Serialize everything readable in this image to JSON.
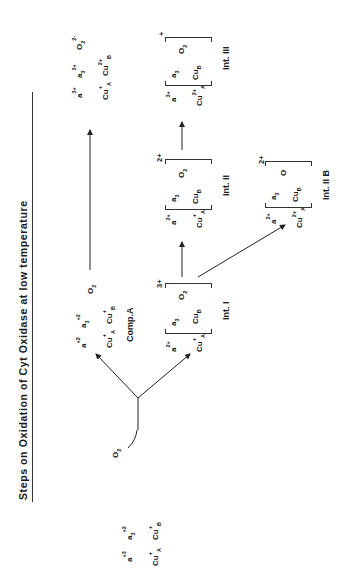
{
  "title": "Steps  on Oxidation of Cyt Oxidase at low temperature",
  "start": {
    "a": "a",
    "a_charge": "+3",
    "a3": "a",
    "a3_sub": "3",
    "a3_charge": "+2",
    "cuA": "Cu",
    "cuA_sup": "+",
    "cuA_sub": "A",
    "cuB": "Cu",
    "cuB_sup": "+",
    "cuB_sub": "B"
  },
  "reagent": {
    "o2": "O",
    "o2_sub": "2"
  },
  "comp_a": {
    "label": "Comp.A",
    "a": "a",
    "a_charge": "+2",
    "a3": "a",
    "a3_sub": "3",
    "a3_charge": "+2",
    "cuA": "Cu",
    "cuA_sup": "+",
    "cuA_sub": "A",
    "cuB": "Cu",
    "cuB_sup": "+",
    "cuB_sub": "B",
    "o2": "O",
    "o2_sub": "2"
  },
  "product_top": {
    "a": "a",
    "a_charge": "3+",
    "a3": "a",
    "a3_sub": "3",
    "a3_charge": "3+",
    "cuA": "Cu",
    "cuA_sup": "+",
    "cuA_sub": "A",
    "cuB": "Cu",
    "cuB_sup": "2+",
    "cuB_sub": "B",
    "o2": "O",
    "o2_sub": "2",
    "o2_charge": "2-"
  },
  "int_1": {
    "label": "Int. I",
    "a": "a",
    "a_charge": "2+",
    "cuA": "Cu",
    "cuA_sup": "+",
    "cuA_sub": "A",
    "a3": "a",
    "a3_sub": "3",
    "cuB": "Cu",
    "cuB_sub": "B",
    "o2": "O",
    "o2_sub": "2",
    "charge": "3+"
  },
  "int_2": {
    "label": "Int. II",
    "a": "a",
    "a_charge": "2+",
    "cuA": "Cu",
    "cuA_sup": "+",
    "cuA_sub": "A",
    "a3": "a",
    "a3_sub": "3",
    "cuB": "Cu",
    "cuB_sub": "B",
    "o2": "O",
    "o2_sub": "2",
    "charge": "2+"
  },
  "int_2b": {
    "label": "Int. II B",
    "a": "a",
    "a_charge": "2+",
    "cuA": "Cu",
    "cuA_sup": "2+",
    "cuA_sub": "A",
    "a3": "a",
    "a3_sub": "3",
    "cuB": "Cu",
    "cuB_sub": "B",
    "o": "O",
    "charge": "2+"
  },
  "int_3": {
    "label": "Int. III",
    "a": "a",
    "a_charge": "3+",
    "cuA": "Cu",
    "cuA_sup": "2+",
    "cuA_sub": "A",
    "a3": "a",
    "a3_sub": "3",
    "cuB": "Cu",
    "cuB_sub": "B",
    "o2": "O",
    "o2_sub": "2",
    "charge": "+"
  },
  "colors": {
    "ink": "#1a1a1a",
    "background": "#ffffff"
  }
}
